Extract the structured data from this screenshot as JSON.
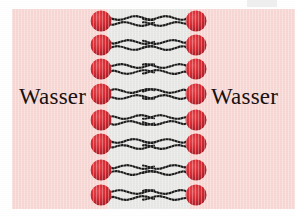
{
  "figure": {
    "name": "phospholipid-bilayer-diagram",
    "width": 295,
    "height": 216
  },
  "labels": {
    "water_left": "Wasser",
    "water_right": "Wasser"
  },
  "colors": {
    "water_background": "#f8d8d5",
    "hydrophobic_core": "#e8e8e6",
    "lipid_head": "#d52b33",
    "lipid_head_shade": "#a81d27",
    "lipid_tail": "#1c1c1c",
    "text": "#17110f",
    "page": "#ffffff"
  },
  "geometry": {
    "background_rect": {
      "x": 12,
      "y": 9,
      "w": 283,
      "h": 200
    },
    "core_rect": {
      "x": 107,
      "y": 9,
      "w": 82,
      "h": 200
    },
    "head_radius": 10.5,
    "row_count": 8,
    "left_head_cx": 101,
    "right_head_cx": 196,
    "row_centers": [
      21,
      45,
      69,
      94,
      120,
      144,
      170,
      195
    ],
    "tail_length": 44,
    "tails_per_lipid": 2
  },
  "elements": {
    "left_leaflet_name": "lipid-leaflet-left",
    "right_leaflet_name": "lipid-leaflet-right",
    "head_name": "lipid-head",
    "tail_name": "lipid-tail",
    "core_name": "hydrophobic-core"
  }
}
